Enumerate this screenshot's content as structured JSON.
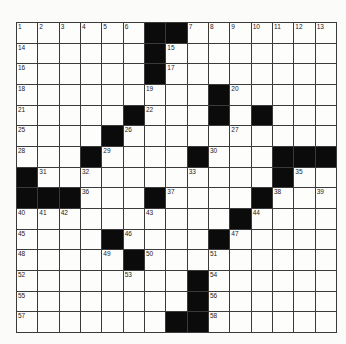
{
  "puzzle": {
    "rows": 15,
    "cols": 15,
    "layout": [
      "......##.......",
      "......#........",
      "......#........",
      ".........#.....",
      ".....#...#.#...",
      "....#..........",
      "...#....#...###",
      "#...........#..#",
      "###...#....#...",
      "..........#....",
      "....#....#.....",
      ".....#.........",
      "........#......",
      "........#......",
      ".......##......"
    ],
    "numbers": [
      [
        1,
        2,
        3,
        4,
        5,
        6,
        0,
        0,
        7,
        8,
        9,
        10,
        11,
        12,
        13
      ],
      [
        14,
        0,
        0,
        0,
        0,
        0,
        0,
        15,
        0,
        0,
        0,
        0,
        0,
        0,
        0
      ],
      [
        16,
        0,
        0,
        0,
        0,
        0,
        0,
        17,
        0,
        0,
        0,
        0,
        0,
        0,
        0
      ],
      [
        18,
        0,
        0,
        0,
        0,
        0,
        19,
        0,
        0,
        0,
        20,
        0,
        0,
        0,
        0
      ],
      [
        21,
        0,
        0,
        0,
        0,
        0,
        22,
        0,
        0,
        23,
        0,
        24,
        0,
        0,
        0
      ],
      [
        25,
        0,
        0,
        0,
        0,
        26,
        0,
        0,
        0,
        0,
        27,
        0,
        0,
        0,
        0
      ],
      [
        28,
        0,
        0,
        0,
        29,
        0,
        0,
        0,
        0,
        30,
        0,
        0,
        0,
        0,
        0
      ],
      [
        0,
        31,
        0,
        32,
        0,
        0,
        0,
        0,
        33,
        0,
        0,
        0,
        34,
        35,
        0
      ],
      [
        0,
        0,
        0,
        36,
        0,
        0,
        0,
        37,
        0,
        0,
        0,
        0,
        38,
        0,
        39
      ],
      [
        40,
        41,
        42,
        0,
        0,
        0,
        43,
        0,
        0,
        0,
        0,
        44,
        0,
        0,
        0
      ],
      [
        45,
        0,
        0,
        0,
        0,
        46,
        0,
        0,
        0,
        0,
        47,
        0,
        0,
        0,
        0
      ],
      [
        48,
        0,
        0,
        0,
        49,
        0,
        50,
        0,
        0,
        51,
        0,
        0,
        0,
        0,
        0
      ],
      [
        52,
        0,
        0,
        0,
        0,
        53,
        0,
        0,
        0,
        54,
        0,
        0,
        0,
        0,
        0
      ],
      [
        55,
        0,
        0,
        0,
        0,
        0,
        0,
        0,
        0,
        56,
        0,
        0,
        0,
        0,
        0
      ],
      [
        57,
        0,
        0,
        0,
        0,
        0,
        0,
        0,
        0,
        58,
        0,
        0,
        0,
        0,
        0
      ]
    ]
  },
  "colors": {
    "block": "#0b0b0b",
    "cell": "#fdfdfc",
    "grid_line": "#3a3a3a"
  }
}
